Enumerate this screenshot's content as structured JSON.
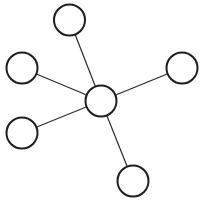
{
  "diagram": {
    "type": "star-graph",
    "stroke_color": "#1e1e1e",
    "fill_color": "#ffffff",
    "nodes": [
      {
        "id": "center",
        "cx": 101,
        "cy": 101,
        "r": 15.5
      },
      {
        "id": "top",
        "cx": 69.5,
        "cy": 20,
        "r": 15.5
      },
      {
        "id": "left-upper",
        "cx": 22,
        "cy": 68,
        "r": 15.5
      },
      {
        "id": "right",
        "cx": 182,
        "cy": 68,
        "r": 15.5
      },
      {
        "id": "left-lower",
        "cx": 22,
        "cy": 133,
        "r": 15.5
      },
      {
        "id": "bottom",
        "cx": 133,
        "cy": 181,
        "r": 15.5
      }
    ],
    "edges": [
      {
        "from": "center",
        "to": "top"
      },
      {
        "from": "center",
        "to": "left-upper"
      },
      {
        "from": "center",
        "to": "right"
      },
      {
        "from": "center",
        "to": "left-lower"
      },
      {
        "from": "center",
        "to": "bottom"
      }
    ]
  }
}
